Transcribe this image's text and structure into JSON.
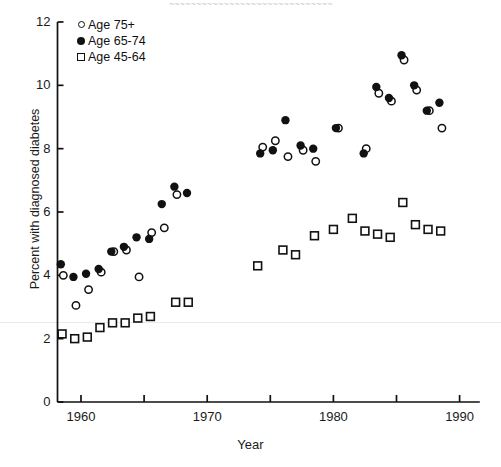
{
  "figure": {
    "scan_title": "~~~~~~~~~~~~~~~~~~~~~~~~~~~~~~",
    "background_color": "#ffffff",
    "ink_color": "#111111"
  },
  "chart_data": {
    "type": "scatter",
    "title": "",
    "xlabel": "Year",
    "ylabel": "Percent with diagnosed diabetes",
    "xlim": [
      1957,
      1992
    ],
    "ylim": [
      0,
      12
    ],
    "xticks": [
      1960,
      1965,
      1970,
      1975,
      1980,
      1985,
      1990
    ],
    "xticklabels": [
      "1960",
      "",
      "1970",
      "",
      "1980",
      "",
      "1990"
    ],
    "yticks": [
      0,
      2,
      4,
      6,
      8,
      10,
      12
    ],
    "yticklabels": [
      "0",
      "2",
      "4",
      "6",
      "8",
      "10",
      "12"
    ],
    "grid": false,
    "legend_position": "upper left",
    "series": [
      {
        "name": "Age 75+",
        "marker": "open-circle",
        "color": "#111111",
        "points": [
          {
            "x": 1958.6,
            "y": 4.0
          },
          {
            "x": 1959.6,
            "y": 3.05
          },
          {
            "x": 1960.6,
            "y": 3.55
          },
          {
            "x": 1961.6,
            "y": 4.1
          },
          {
            "x": 1962.6,
            "y": 4.75
          },
          {
            "x": 1963.6,
            "y": 4.8
          },
          {
            "x": 1964.6,
            "y": 3.95
          },
          {
            "x": 1965.6,
            "y": 5.35
          },
          {
            "x": 1966.6,
            "y": 5.5
          },
          {
            "x": 1967.6,
            "y": 6.55
          },
          {
            "x": 1974.4,
            "y": 8.05
          },
          {
            "x": 1975.4,
            "y": 8.25
          },
          {
            "x": 1976.4,
            "y": 7.75
          },
          {
            "x": 1977.6,
            "y": 7.95
          },
          {
            "x": 1978.6,
            "y": 7.6
          },
          {
            "x": 1980.4,
            "y": 8.65
          },
          {
            "x": 1982.6,
            "y": 8.0
          },
          {
            "x": 1983.6,
            "y": 9.75
          },
          {
            "x": 1984.6,
            "y": 9.5
          },
          {
            "x": 1985.6,
            "y": 10.8
          },
          {
            "x": 1986.6,
            "y": 9.85
          },
          {
            "x": 1987.6,
            "y": 9.2
          },
          {
            "x": 1988.6,
            "y": 8.65
          }
        ]
      },
      {
        "name": "Age 65-74",
        "marker": "filled-circle",
        "color": "#111111",
        "points": [
          {
            "x": 1958.4,
            "y": 4.35
          },
          {
            "x": 1959.4,
            "y": 3.95
          },
          {
            "x": 1960.4,
            "y": 4.05
          },
          {
            "x": 1961.4,
            "y": 4.2
          },
          {
            "x": 1962.4,
            "y": 4.75
          },
          {
            "x": 1963.4,
            "y": 4.9
          },
          {
            "x": 1964.4,
            "y": 5.2
          },
          {
            "x": 1965.4,
            "y": 5.15
          },
          {
            "x": 1966.4,
            "y": 6.25
          },
          {
            "x": 1967.4,
            "y": 6.8
          },
          {
            "x": 1968.4,
            "y": 6.6
          },
          {
            "x": 1974.2,
            "y": 7.85
          },
          {
            "x": 1975.2,
            "y": 7.95
          },
          {
            "x": 1976.2,
            "y": 8.9
          },
          {
            "x": 1977.4,
            "y": 8.1
          },
          {
            "x": 1978.4,
            "y": 8.0
          },
          {
            "x": 1980.2,
            "y": 8.65
          },
          {
            "x": 1982.4,
            "y": 7.85
          },
          {
            "x": 1983.4,
            "y": 9.95
          },
          {
            "x": 1984.4,
            "y": 9.6
          },
          {
            "x": 1985.4,
            "y": 10.95
          },
          {
            "x": 1986.4,
            "y": 10.0
          },
          {
            "x": 1987.4,
            "y": 9.2
          },
          {
            "x": 1988.4,
            "y": 9.45
          }
        ]
      },
      {
        "name": "Age 45-64",
        "marker": "open-square",
        "color": "#111111",
        "points": [
          {
            "x": 1958.5,
            "y": 2.15
          },
          {
            "x": 1959.5,
            "y": 2.0
          },
          {
            "x": 1960.5,
            "y": 2.05
          },
          {
            "x": 1961.5,
            "y": 2.35
          },
          {
            "x": 1962.5,
            "y": 2.5
          },
          {
            "x": 1963.5,
            "y": 2.5
          },
          {
            "x": 1964.5,
            "y": 2.65
          },
          {
            "x": 1965.5,
            "y": 2.7
          },
          {
            "x": 1967.5,
            "y": 3.15
          },
          {
            "x": 1968.5,
            "y": 3.15
          },
          {
            "x": 1974.0,
            "y": 4.3
          },
          {
            "x": 1976.0,
            "y": 4.8
          },
          {
            "x": 1977.0,
            "y": 4.65
          },
          {
            "x": 1978.5,
            "y": 5.25
          },
          {
            "x": 1980.0,
            "y": 5.45
          },
          {
            "x": 1981.5,
            "y": 5.8
          },
          {
            "x": 1982.5,
            "y": 5.4
          },
          {
            "x": 1983.5,
            "y": 5.3
          },
          {
            "x": 1984.5,
            "y": 5.2
          },
          {
            "x": 1985.5,
            "y": 6.3
          },
          {
            "x": 1986.5,
            "y": 5.6
          },
          {
            "x": 1987.5,
            "y": 5.45
          },
          {
            "x": 1988.5,
            "y": 5.4
          }
        ]
      }
    ]
  },
  "legend": {
    "items": [
      {
        "label": "Age 75+",
        "marker": "open-circle-icon"
      },
      {
        "label": "Age 65-74",
        "marker": "filled-circle-icon"
      },
      {
        "label": "Age 45-64",
        "marker": "open-square-icon"
      }
    ]
  }
}
